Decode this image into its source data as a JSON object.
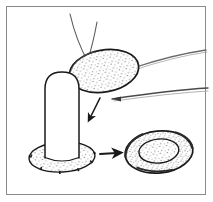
{
  "figure": {
    "title": "Surgical graft placement sequence illustration",
    "type": "line-drawing-diagram",
    "panel_count": 1,
    "background_color": "#ffffff",
    "ink_color": "#1a1a1a",
    "stipple_color": "#3a3a3a",
    "frame": {
      "name": "figure-border",
      "color": "#8a8a8a",
      "stroke_width": 1,
      "inset": 6
    }
  },
  "objects": {
    "graft_disc": {
      "label": "graft-disc",
      "description": "stippled oval graft held by forceps",
      "center_x": 104,
      "center_y": 71,
      "radius_x": 35,
      "radius_y": 21,
      "rotation_deg": -10,
      "fill": "#ffffff",
      "outline_color": "#1a1a1a",
      "outline_width": 1.6,
      "stippled": true
    },
    "post": {
      "label": "cylindrical-post",
      "description": "vertical rounded cylinder standing on stippled base",
      "left_x": 45,
      "right_x": 79,
      "top_y": 72,
      "bottom_y": 160,
      "cap_radius": 17,
      "fill": "#ffffff",
      "outline_color": "#1a1a1a",
      "outline_width": 1.5
    },
    "post_base": {
      "label": "post-base-ellipse",
      "description": "stippled elliptical base ring beneath the post",
      "center_x": 62,
      "center_y": 157,
      "radius_x": 33,
      "radius_y": 15,
      "rotation_deg": -3,
      "fill": "#ffffff",
      "outline_color": "#1a1a1a",
      "outline_width": 1.4,
      "stippled": true,
      "rim_ticks": 6
    },
    "result_annulus": {
      "label": "result-annulus",
      "description": "finished donut shaped result with outer ring and inner disc",
      "center_x": 159,
      "center_y": 152,
      "outer_radius_x": 34,
      "outer_radius_y": 21,
      "inner_radius_x": 20,
      "inner_radius_y": 12,
      "rotation_deg": -6,
      "fill": "#ffffff",
      "outline_color": "#1a1a1a",
      "outline_width": 1.6,
      "stippled": true
    }
  },
  "instruments": {
    "upper_forceps": {
      "label": "upper-forceps",
      "description": "two thin converging instrument shafts entering from top",
      "color": "#5a5a5a",
      "stroke_width": 1.1,
      "arms": [
        {
          "x1": 70,
          "y1": 14,
          "cx": 76,
          "cy": 40,
          "x2": 88,
          "y2": 62
        },
        {
          "x1": 97,
          "y1": 22,
          "cx": 93,
          "cy": 44,
          "x2": 87,
          "y2": 63
        }
      ]
    },
    "right_forceps": {
      "label": "right-forceps",
      "description": "forceps entering from right edge gripping the graft disc",
      "color": "#5a5a5a",
      "stroke_width": 1.2,
      "arms": [
        {
          "x1": 205,
          "y1": 50,
          "cx": 170,
          "cy": 56,
          "x2": 133,
          "y2": 69
        },
        {
          "x1": 206,
          "y1": 88,
          "cx": 170,
          "cy": 90,
          "x2": 112,
          "y2": 99
        }
      ]
    }
  },
  "arrows": {
    "placement_arrow": {
      "label": "placement-arrow-down",
      "description": "arrow showing graft moving down onto the post",
      "direction": "down-left",
      "x1": 100,
      "y1": 98,
      "x2": 89,
      "y2": 120,
      "color": "#1a1a1a",
      "stroke_width": 1.6
    },
    "result_arrow": {
      "label": "result-arrow-right",
      "description": "arrow showing transition to the finished result",
      "direction": "right",
      "x1": 101,
      "y1": 154,
      "x2": 120,
      "y2": 154,
      "color": "#1a1a1a",
      "stroke_width": 1.8
    }
  },
  "stipple": {
    "dot_radius": 0.5,
    "dot_color": "#3a3a3a",
    "density": "sparse"
  }
}
